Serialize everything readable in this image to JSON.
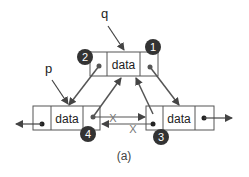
{
  "diagram": {
    "caption": "(a)",
    "pointers": {
      "q": "q",
      "p": "p"
    },
    "nodes": [
      {
        "id": "top",
        "label": "data"
      },
      {
        "id": "left",
        "label": "data"
      },
      {
        "id": "right",
        "label": "data"
      }
    ],
    "steps": [
      "1",
      "2",
      "3",
      "4"
    ],
    "removed_link_mark": "X",
    "colors": {
      "box_stroke": "#555555",
      "arrow_stroke": "#555555",
      "step_fill": "#333333",
      "step_text": "#ffffff",
      "text": "#222222"
    }
  }
}
